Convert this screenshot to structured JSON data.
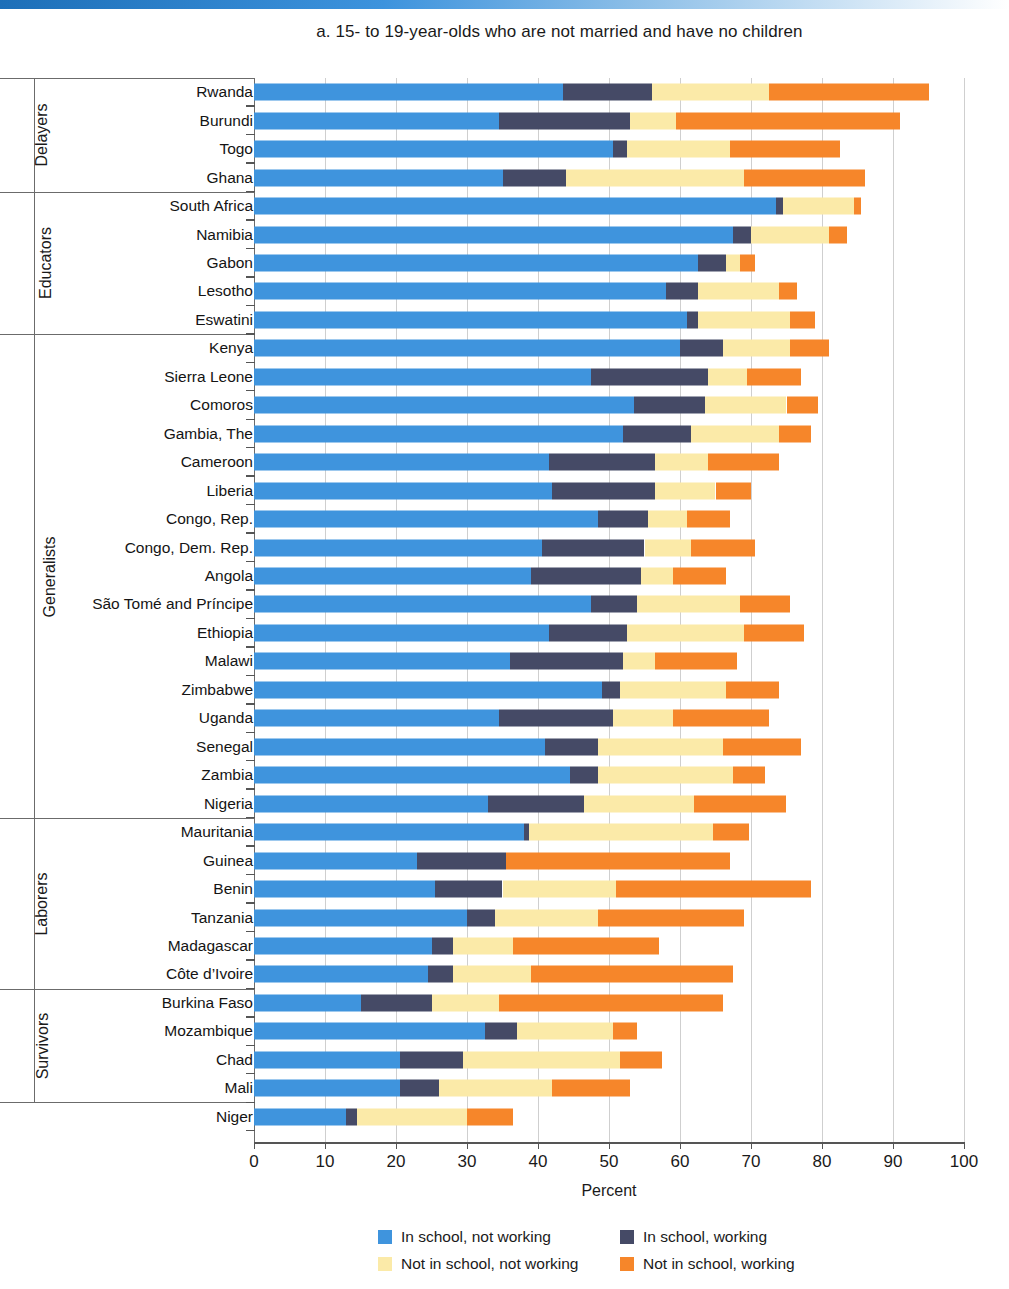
{
  "panel": {
    "title": "a. 15- to 19-year-olds who are not married and have no children"
  },
  "axis": {
    "title": "Percent",
    "ticks": [
      "0",
      "10",
      "20",
      "30",
      "40",
      "50",
      "60",
      "70",
      "80",
      "90",
      "100"
    ]
  },
  "legend": [
    {
      "label": "In school, not working",
      "color": "#3f94dd"
    },
    {
      "label": "In school, working",
      "color": "#454a66"
    },
    {
      "label": "Not in school, not working",
      "color": "#fbeaa8"
    },
    {
      "label": "Not in school, working",
      "color": "#f6862a"
    }
  ],
  "groups": [
    {
      "label": "Delayers",
      "count": 4
    },
    {
      "label": "Educators",
      "count": 5
    },
    {
      "label": "Generalists",
      "count": 17
    },
    {
      "label": "Laborers",
      "count": 6
    },
    {
      "label": "Survivors",
      "count": 4
    }
  ],
  "chart_data": {
    "type": "bar",
    "orientation": "horizontal",
    "stacked": true,
    "title": "a. 15- to 19-year-olds who are not married and have no children",
    "xlabel": "Percent",
    "ylabel": "",
    "xlim": [
      0,
      100
    ],
    "xticks": [
      0,
      10,
      20,
      30,
      40,
      50,
      60,
      70,
      80,
      90,
      100
    ],
    "grid": "vertical",
    "legend_position": "bottom",
    "series": [
      {
        "name": "In school, not working",
        "color": "#3f94dd"
      },
      {
        "name": "In school, working",
        "color": "#454a66"
      },
      {
        "name": "Not in school, not working",
        "color": "#fbeaa8"
      },
      {
        "name": "Not in school, working",
        "color": "#f6862a"
      }
    ],
    "groups": [
      "Delayers",
      "Educators",
      "Generalists",
      "Laborers",
      "Survivors"
    ],
    "categories": [
      "Rwanda",
      "Burundi",
      "Togo",
      "Ghana",
      "South Africa",
      "Namibia",
      "Gabon",
      "Lesotho",
      "Eswatini",
      "Kenya",
      "Sierra Leone",
      "Comoros",
      "Gambia, The",
      "Cameroon",
      "Liberia",
      "Congo, Rep.",
      "Congo, Dem. Rep.",
      "Angola",
      "São Tomé and Príncipe",
      "Ethiopia",
      "Malawi",
      "Zimbabwe",
      "Uganda",
      "Senegal",
      "Zambia",
      "Nigeria",
      "Mauritania",
      "Guinea",
      "Benin",
      "Tanzania",
      "Madagascar",
      "Côte d’Ivoire",
      "Burkina Faso",
      "Mozambique",
      "Chad",
      "Mali",
      "Niger"
    ],
    "rows": [
      {
        "country": "Rwanda",
        "group": "Delayers",
        "values": [
          43.5,
          12.5,
          16.5,
          22.5
        ],
        "total": 95.0
      },
      {
        "country": "Burundi",
        "group": "Delayers",
        "values": [
          34.5,
          18.5,
          6.5,
          31.5
        ],
        "total": 91.0
      },
      {
        "country": "Togo",
        "group": "Delayers",
        "values": [
          50.5,
          2.0,
          14.5,
          15.5
        ],
        "total": 82.5
      },
      {
        "country": "Ghana",
        "group": "Delayers",
        "values": [
          35.0,
          9.0,
          25.0,
          17.0
        ],
        "total": 86.0
      },
      {
        "country": "South Africa",
        "group": "Educators",
        "values": [
          73.5,
          1.0,
          10.0,
          1.0
        ],
        "total": 85.5
      },
      {
        "country": "Namibia",
        "group": "Educators",
        "values": [
          67.5,
          2.5,
          11.0,
          2.5
        ],
        "total": 83.5
      },
      {
        "country": "Gabon",
        "group": "Educators",
        "values": [
          62.5,
          4.0,
          2.0,
          2.0
        ],
        "total": 70.5
      },
      {
        "country": "Lesotho",
        "group": "Educators",
        "values": [
          58.0,
          4.5,
          11.5,
          2.5
        ],
        "total": 76.5
      },
      {
        "country": "Eswatini",
        "group": "Educators",
        "values": [
          61.0,
          1.5,
          13.0,
          3.5
        ],
        "total": 79.0
      },
      {
        "country": "Kenya",
        "group": "Generalists",
        "values": [
          60.0,
          6.0,
          9.5,
          5.5
        ],
        "total": 81.0
      },
      {
        "country": "Sierra Leone",
        "group": "Generalists",
        "values": [
          47.5,
          16.5,
          5.5,
          7.5
        ],
        "total": 77.0
      },
      {
        "country": "Comoros",
        "group": "Generalists",
        "values": [
          53.5,
          10.0,
          11.5,
          4.5
        ],
        "total": 79.5
      },
      {
        "country": "Gambia, The",
        "group": "Generalists",
        "values": [
          52.0,
          9.5,
          12.5,
          4.5
        ],
        "total": 78.5
      },
      {
        "country": "Cameroon",
        "group": "Generalists",
        "values": [
          41.5,
          15.0,
          7.5,
          10.0
        ],
        "total": 74.0
      },
      {
        "country": "Liberia",
        "group": "Generalists",
        "values": [
          42.0,
          14.5,
          8.5,
          5.0
        ],
        "total": 70.0
      },
      {
        "country": "Congo, Rep.",
        "group": "Generalists",
        "values": [
          48.5,
          7.0,
          5.5,
          6.0
        ],
        "total": 67.0
      },
      {
        "country": "Congo, Dem. Rep.",
        "group": "Generalists",
        "values": [
          40.5,
          14.5,
          6.5,
          9.0
        ],
        "total": 70.5
      },
      {
        "country": "Angola",
        "group": "Generalists",
        "values": [
          39.0,
          15.5,
          4.5,
          7.5
        ],
        "total": 66.5
      },
      {
        "country": "São Tomé and Príncipe",
        "group": "Generalists",
        "values": [
          47.5,
          6.5,
          14.5,
          7.0
        ],
        "total": 75.5
      },
      {
        "country": "Ethiopia",
        "group": "Generalists",
        "values": [
          41.5,
          11.0,
          16.5,
          8.5
        ],
        "total": 77.5
      },
      {
        "country": "Malawi",
        "group": "Generalists",
        "values": [
          36.0,
          16.0,
          4.5,
          11.5
        ],
        "total": 68.0
      },
      {
        "country": "Zimbabwe",
        "group": "Generalists",
        "values": [
          49.0,
          2.5,
          15.0,
          7.5
        ],
        "total": 74.0
      },
      {
        "country": "Uganda",
        "group": "Generalists",
        "values": [
          34.5,
          16.0,
          8.5,
          13.5
        ],
        "total": 72.5
      },
      {
        "country": "Senegal",
        "group": "Generalists",
        "values": [
          41.0,
          7.5,
          17.5,
          11.0
        ],
        "total": 77.0
      },
      {
        "country": "Zambia",
        "group": "Generalists",
        "values": [
          44.5,
          4.0,
          19.0,
          4.5
        ],
        "total": 72.0
      },
      {
        "country": "Nigeria",
        "group": "Generalists",
        "values": [
          33.0,
          13.5,
          15.5,
          13.0
        ],
        "total": 75.0
      },
      {
        "country": "Mauritania",
        "group": "Generalists",
        "values": [
          38.0,
          0.7,
          26.0,
          5.0
        ],
        "total": 69.7
      },
      {
        "country": "Guinea",
        "group": "Laborers",
        "values": [
          23.0,
          12.5,
          0.0,
          31.5
        ],
        "total": 67.0
      },
      {
        "country": "Benin",
        "group": "Laborers",
        "values": [
          25.5,
          9.5,
          16.0,
          27.5
        ],
        "total": 78.5
      },
      {
        "country": "Tanzania",
        "group": "Laborers",
        "values": [
          30.0,
          4.0,
          14.5,
          20.5
        ],
        "total": 69.0
      },
      {
        "country": "Madagascar",
        "group": "Laborers",
        "values": [
          25.0,
          3.0,
          8.5,
          20.5
        ],
        "total": 57.0
      },
      {
        "country": "Côte d’Ivoire",
        "group": "Laborers",
        "values": [
          24.5,
          3.5,
          11.0,
          28.5
        ],
        "total": 67.5
      },
      {
        "country": "Burkina Faso",
        "group": "Laborers",
        "values": [
          15.0,
          10.0,
          9.5,
          31.5
        ],
        "total": 66.0
      },
      {
        "country": "Mozambique",
        "group": "Survivors",
        "values": [
          32.5,
          4.5,
          13.5,
          3.5
        ],
        "total": 54.0
      },
      {
        "country": "Chad",
        "group": "Survivors",
        "values": [
          20.5,
          9.0,
          22.0,
          6.0
        ],
        "total": 57.5
      },
      {
        "country": "Mali",
        "group": "Survivors",
        "values": [
          20.5,
          5.5,
          16.0,
          11.0
        ],
        "total": 53.0
      },
      {
        "country": "Niger",
        "group": "Survivors",
        "values": [
          13.0,
          1.5,
          15.5,
          6.5
        ],
        "total": 36.5
      }
    ]
  }
}
